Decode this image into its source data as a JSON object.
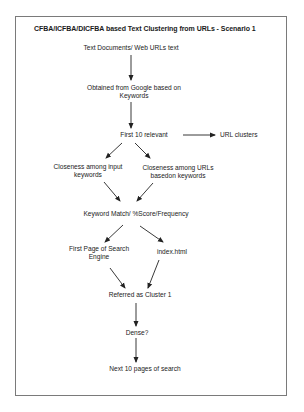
{
  "diagram": {
    "title": "CFBA/ICFBA/DICFBA based Text Clustering from URLs - Scenario 1",
    "nodes": {
      "source": {
        "line1": "Text Documents/ Web URLs text"
      },
      "obtained": {
        "line1": "Obtained from Google based on",
        "line2": "Keywords"
      },
      "first10": {
        "line1": "First 10 relevant"
      },
      "urlclusters": {
        "line1": "URL clusters"
      },
      "closeness_input": {
        "line1": "Closeness among input",
        "line2": "keywords"
      },
      "closeness_urls": {
        "line1": "Closeness among URLs",
        "line2": "basedon keywords"
      },
      "keyword_match": {
        "line1": "Keyword Match/ %Score/Frequency"
      },
      "first_page": {
        "line1": "First Page of Search",
        "line2": "Engine"
      },
      "index_html": {
        "line1": "index.html"
      },
      "cluster1": {
        "line1": "Referred as Cluster 1"
      },
      "dense": {
        "line1": "Dense?"
      },
      "next10": {
        "line1": "Next 10 pages of search"
      }
    },
    "edges": [
      {
        "from": "source",
        "to": "obtained"
      },
      {
        "from": "obtained",
        "to": "first10"
      },
      {
        "from": "first10",
        "to": "urlclusters"
      },
      {
        "from": "first10",
        "to": "closeness_input"
      },
      {
        "from": "first10",
        "to": "closeness_urls"
      },
      {
        "from": "closeness_input",
        "to": "keyword_match"
      },
      {
        "from": "closeness_urls",
        "to": "keyword_match"
      },
      {
        "from": "keyword_match",
        "to": "first_page"
      },
      {
        "from": "keyword_match",
        "to": "index_html"
      },
      {
        "from": "first_page",
        "to": "cluster1"
      },
      {
        "from": "index_html",
        "to": "cluster1"
      },
      {
        "from": "cluster1",
        "to": "dense"
      },
      {
        "from": "dense",
        "to": "next10"
      }
    ],
    "colors": {
      "border": "#7a7a7a",
      "text": "#222222",
      "background": "#ffffff"
    }
  }
}
